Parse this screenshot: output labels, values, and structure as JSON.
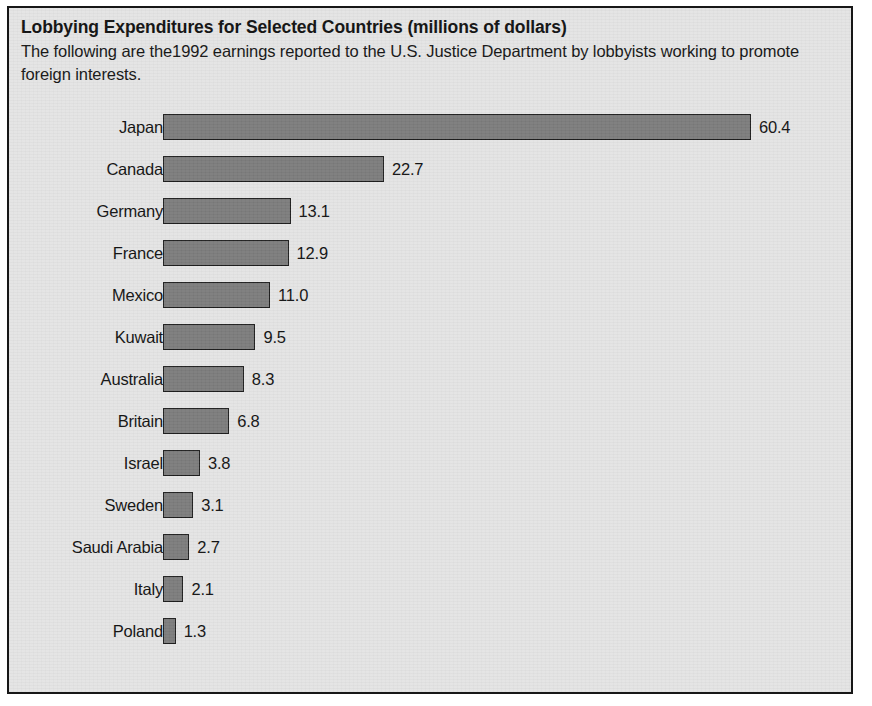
{
  "figure": {
    "title": "Lobbying Expenditures for Selected Countries (millions of dollars)",
    "subtitle": "The following are the1992 earnings reported to the U.S. Justice Department by lobbyists working to promote foreign interests.",
    "border_color": "#171717",
    "background_color": "#e4e4e4",
    "bar_color": "#7c7c7c",
    "bar_outline_color": "#1d1d1d",
    "text_color": "#111111"
  },
  "chart_data": {
    "type": "bar",
    "orientation": "horizontal",
    "title": "Lobbying Expenditures for Selected Countries (millions of dollars)",
    "subtitle": "The following are the1992 earnings reported to the U.S. Justice Department by lobbyists working to promote foreign interests.",
    "xlabel": "",
    "ylabel": "",
    "unit": "millions of dollars",
    "grid": false,
    "legend": false,
    "xlim": [
      0,
      60.4
    ],
    "categories": [
      "Japan",
      "Canada",
      "Germany",
      "France",
      "Mexico",
      "Kuwait",
      "Australia",
      "Britain",
      "Israel",
      "Sweden",
      "Saudi Arabia",
      "Italy",
      "Poland"
    ],
    "values": [
      60.4,
      22.7,
      13.1,
      12.9,
      11.0,
      9.5,
      8.3,
      6.8,
      3.8,
      3.1,
      2.7,
      2.1,
      1.3
    ],
    "value_labels": [
      "60.4",
      "22.7",
      "13.1",
      "12.9",
      "11.0",
      "9.5",
      "8.3",
      "6.8",
      "3.8",
      "3.1",
      "2.7",
      "2.1",
      "1.3"
    ]
  }
}
